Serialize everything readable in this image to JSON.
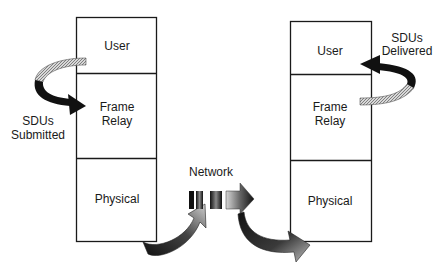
{
  "diagram": {
    "left_stack": {
      "layers": [
        {
          "label_lines": [
            "User"
          ]
        },
        {
          "label_lines": [
            "Frame",
            "Relay"
          ]
        },
        {
          "label_lines": [
            "Physical"
          ]
        }
      ]
    },
    "right_stack": {
      "layers": [
        {
          "label_lines": [
            "User"
          ]
        },
        {
          "label_lines": [
            "Frame",
            "Relay"
          ]
        },
        {
          "label_lines": [
            "Physical"
          ]
        }
      ]
    },
    "annotations": {
      "submitted": [
        "SDUs",
        "Submitted"
      ],
      "delivered": [
        "SDUs",
        "Delivered"
      ],
      "network": "Network"
    },
    "colors": {
      "line": "#1a1a1a",
      "arrow_dark": "#111111",
      "arrow_light": "#c8c8c8",
      "hatch": "#9a9a9a"
    }
  }
}
